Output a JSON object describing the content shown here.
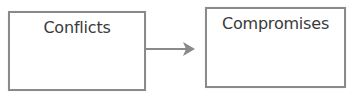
{
  "diagram": {
    "nodes": [
      {
        "id": "conflicts",
        "label": "Conflicts"
      },
      {
        "id": "compromises",
        "label": "Compromises"
      }
    ],
    "edges": [
      {
        "from": "conflicts",
        "to": "compromises",
        "type": "arrow"
      }
    ],
    "colors": {
      "border": "#8a8a8a",
      "text": "#3a3a3a",
      "arrow": "#8a8a8a",
      "background": "#ffffff"
    }
  }
}
